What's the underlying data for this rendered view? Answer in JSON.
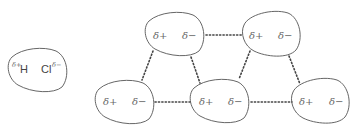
{
  "diagram": {
    "isolated_molecule": {
      "atom1": "H",
      "atom1_charge": "δ+",
      "atom2": "Cl",
      "atom2_charge": "δ−"
    },
    "molecules": [
      {
        "id": "m1",
        "positive": "δ+",
        "negative": "δ−"
      },
      {
        "id": "m2",
        "positive": "δ+",
        "negative": "δ−"
      },
      {
        "id": "m3",
        "positive": "δ+",
        "negative": "δ−"
      },
      {
        "id": "m4",
        "positive": "δ+",
        "negative": "δ−"
      },
      {
        "id": "m5",
        "positive": "δ+",
        "negative": "δ−"
      }
    ],
    "interactions": [
      {
        "from": "m1",
        "to": "m2"
      },
      {
        "from": "m1",
        "to": "m3"
      },
      {
        "from": "m1",
        "to": "m4"
      },
      {
        "from": "m2",
        "to": "m4"
      },
      {
        "from": "m2",
        "to": "m5"
      },
      {
        "from": "m3",
        "to": "m4"
      },
      {
        "from": "m4",
        "to": "m5"
      }
    ],
    "colors": {
      "outline": "#555555",
      "text": "#666666",
      "dotted_line": "#444444"
    }
  }
}
